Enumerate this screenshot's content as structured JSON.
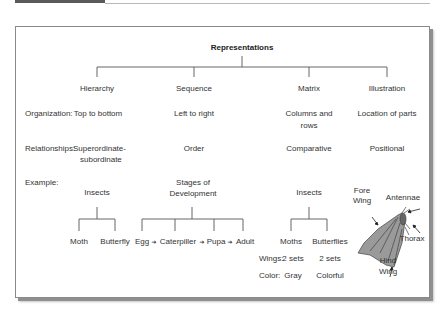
{
  "title": "Representations",
  "columns": [
    {
      "name": "Hierarchy",
      "organization": "Top to bottom",
      "relationships_line1": "Superordinate-",
      "relationships_line2": "subordinate"
    },
    {
      "name": "Sequence",
      "organization": "Left to right",
      "relationships": "Order"
    },
    {
      "name": "Matrix",
      "organization_line1": "Columns and",
      "organization_line2": "rows",
      "relationships": "Comparative"
    },
    {
      "name": "Illustration",
      "organization": "Location of parts",
      "relationships": "Positional"
    }
  ],
  "row_labels": {
    "organization": "Organization:",
    "relationships": "Relationships:",
    "example": "Example:"
  },
  "examples": {
    "hierarchy": {
      "root": "Insects",
      "children": [
        "Moth",
        "Butterfly"
      ]
    },
    "sequence": {
      "root_line1": "Stages of",
      "root_line2": "Development",
      "steps": [
        "Egg",
        "Caterpiller",
        "Pupa",
        "Adult"
      ],
      "arrow": "➔"
    },
    "matrix": {
      "root": "Insects",
      "columns": [
        "Moths",
        "Butterflies"
      ],
      "rows": [
        {
          "label": "Wings:",
          "values": [
            "2 sets",
            "2 sets"
          ]
        },
        {
          "label": "Color:",
          "values": [
            "Gray",
            "Colorful"
          ]
        }
      ]
    },
    "illustration": {
      "labels": {
        "fore_wing_line1": "Fore",
        "fore_wing_line2": "Wing",
        "antennae": "Antennae",
        "thorax": "Thorax",
        "hind_wing_line1": "Hind",
        "hind_wing_line2": "Wing"
      }
    }
  }
}
